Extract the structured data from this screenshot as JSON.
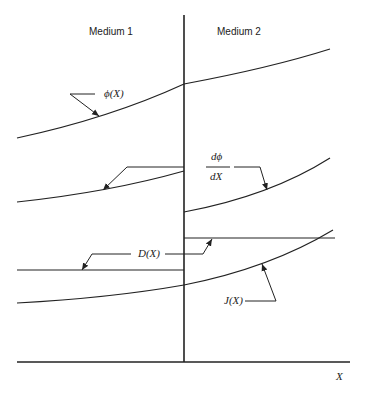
{
  "diagram": {
    "regions": {
      "left": "Medium 1",
      "right": "Medium 2"
    },
    "axis_label": "X",
    "curves": [
      {
        "name": "phi",
        "label": "ϕ(X)",
        "description": "continuous at interface, change of slope"
      },
      {
        "name": "dphi_dx",
        "label_num": "dϕ",
        "label_den": "dX",
        "description": "discontinuous at interface (jumps up)"
      },
      {
        "name": "D",
        "label": "D(X)",
        "description": "piecewise constant, jumps up at interface"
      },
      {
        "name": "J",
        "label": "J(X)",
        "description": "continuous across interface"
      }
    ]
  }
}
